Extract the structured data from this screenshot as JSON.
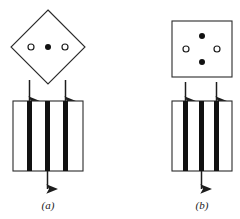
{
  "figure": {
    "name": "two-panel-crystal-diffraction-diagram",
    "background": "#ffffff",
    "stroke_color": "#2b2b2b",
    "bar_color": "#111111",
    "open_dot_fill": "#ffffff",
    "filled_dot_fill": "#111111",
    "width": 240,
    "height": 219
  },
  "panels": [
    {
      "id": "a",
      "label": "(a)",
      "label_pos": {
        "x": 48,
        "y": 207
      },
      "shape": {
        "name": "diamond",
        "type": "rotated-square",
        "center": {
          "x": 48,
          "y": 47
        },
        "half_diagonal": 37
      },
      "dots": [
        {
          "type": "open",
          "cx": 31,
          "cy": 47,
          "r": 3.0
        },
        {
          "type": "filled",
          "cx": 48,
          "cy": 47,
          "r": 3.0
        },
        {
          "type": "open",
          "cx": 65,
          "cy": 47,
          "r": 3.0
        }
      ],
      "grating": {
        "x": 13,
        "y": 101,
        "width": 70,
        "height": 70,
        "bars": [
          {
            "x": 27,
            "width": 5
          },
          {
            "x": 45,
            "width": 5
          },
          {
            "x": 63,
            "width": 5
          }
        ]
      },
      "arrows_up": [
        {
          "x": 29.5,
          "y_tail": 101,
          "y_head": 79
        },
        {
          "x": 65.5,
          "y_tail": 101,
          "y_head": 79
        }
      ],
      "arrows_down": [
        {
          "x": 47.5,
          "y_tail": 171,
          "y_head": 190
        }
      ]
    },
    {
      "id": "b",
      "label": "(b)",
      "label_pos": {
        "x": 202,
        "y": 207
      },
      "shape": {
        "name": "square",
        "type": "upright-square",
        "x": 172,
        "y": 21,
        "width": 60,
        "height": 56
      },
      "dots": [
        {
          "type": "filled",
          "cx": 202,
          "cy": 36,
          "r": 3.0
        },
        {
          "type": "open",
          "cx": 186,
          "cy": 49,
          "r": 3.0
        },
        {
          "type": "open",
          "cx": 217,
          "cy": 49,
          "r": 3.0
        },
        {
          "type": "filled",
          "cx": 202,
          "cy": 62,
          "r": 3.0
        }
      ],
      "grating": {
        "x": 172,
        "y": 101,
        "width": 60,
        "height": 70,
        "bars": [
          {
            "x": 183,
            "width": 5
          },
          {
            "x": 199,
            "width": 5
          },
          {
            "x": 214,
            "width": 5
          }
        ]
      },
      "arrows_up": [
        {
          "x": 185.5,
          "y_tail": 101,
          "y_head": 81
        },
        {
          "x": 216.5,
          "y_tail": 101,
          "y_head": 81
        }
      ],
      "arrows_down": [
        {
          "x": 201.5,
          "y_tail": 171,
          "y_head": 190
        }
      ]
    }
  ]
}
